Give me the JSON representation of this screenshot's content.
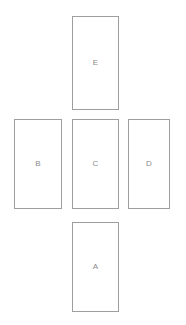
{
  "diagram": {
    "type": "box-layout",
    "canvas": {
      "width": 186,
      "height": 325,
      "background_color": "#ffffff"
    },
    "style": {
      "box_fill_color": "#ffffff",
      "box_border_color": "#9e9e9e",
      "label_text_color": "#8a8a8a"
    },
    "boxes": [
      {
        "id": "e",
        "label": "E",
        "position": "top",
        "x": 72,
        "y": 16,
        "width": 47,
        "height": 94
      },
      {
        "id": "b",
        "label": "B",
        "position": "middle-left",
        "x": 14,
        "y": 119,
        "width": 48,
        "height": 90
      },
      {
        "id": "c",
        "label": "C",
        "position": "middle-center",
        "x": 72,
        "y": 119,
        "width": 47,
        "height": 90
      },
      {
        "id": "d",
        "label": "D",
        "position": "middle-right",
        "x": 128,
        "y": 119,
        "width": 42,
        "height": 90
      },
      {
        "id": "a",
        "label": "A",
        "position": "bottom",
        "x": 72,
        "y": 222,
        "width": 47,
        "height": 90
      }
    ]
  }
}
